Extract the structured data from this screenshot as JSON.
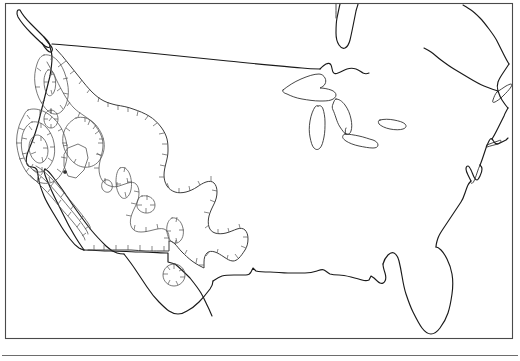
{
  "figure": {
    "kind": "map",
    "region_title": "North America",
    "frame": {
      "x": 5,
      "y": 3,
      "width": 508,
      "height": 336
    },
    "canvas": {
      "width": 520,
      "height": 361
    },
    "background_color": "#ffffff",
    "frame_color": "#4a4a4a",
    "coastline_color": "#1a1a1a",
    "contour_color": "#555555",
    "has_labels": false,
    "has_legend": false,
    "has_scale_bar": false,
    "has_north_arrow": false,
    "caption": ""
  },
  "layers": [
    {
      "id": "frame",
      "label": "map-frame"
    },
    {
      "id": "coastline",
      "label": "continental-coastline"
    },
    {
      "id": "lakes",
      "label": "great-lakes"
    },
    {
      "id": "borders",
      "label": "national-borders"
    },
    {
      "id": "contours",
      "label": "hachured-depression-contours"
    },
    {
      "id": "point",
      "label": "point-marker"
    },
    {
      "id": "rule",
      "label": "horizontal-rule"
    }
  ],
  "geography": {
    "continent_outline": "M 148 44 L 150 44 C 175 42 200 44 228 48 C 258 53 286 59 310 66 L 316 38 L 318 10 L 322 5 L 330 5 L 336 14 L 344 25 L 352 33 L 356 31 L 354 22 L 352 12 L 354 5 L 360 5 L 368 16 L 378 27 L 390 34 L 402 36 L 416 30 L 430 22 L 444 14 L 458 7 L 468 5 L 494 5 L 506 6",
    "coast_segments": [
      "west-coast-baja",
      "pacific-northwest",
      "vancouver-island",
      "canada-border-49th",
      "great-lakes",
      "st-lawrence",
      "new-england",
      "atlantic-coast",
      "florida-peninsula",
      "gulf-coast",
      "texas-coast",
      "mexico-border"
    ],
    "lake_names": [
      "Superior",
      "Michigan",
      "Huron",
      "Erie",
      "Ontario"
    ]
  },
  "contour_set": {
    "style": "hachured-closed-contours",
    "hachure_direction": "inward",
    "region": "western-united-states",
    "level_count": 6,
    "levels": [],
    "units": "",
    "loops": [
      {
        "name": "outer-western-boundary",
        "closed": true
      },
      {
        "name": "pacific-northwest-loop",
        "closed": true
      },
      {
        "name": "california-nevada-core",
        "closed": true
      },
      {
        "name": "great-basin-inner",
        "closed": true
      },
      {
        "name": "oregon-small-ellipse",
        "closed": true
      },
      {
        "name": "idaho-small-ellipse",
        "closed": true
      },
      {
        "name": "wyoming-ellipse",
        "closed": true
      },
      {
        "name": "colorado-small-ellipse",
        "closed": true
      },
      {
        "name": "utah-small-blob",
        "closed": true
      },
      {
        "name": "new-mexico-ellipse",
        "closed": true
      },
      {
        "name": "texas-border-circle",
        "closed": true
      }
    ]
  },
  "rule": {
    "y": 355,
    "x_start": 2,
    "x_end": 518
  }
}
